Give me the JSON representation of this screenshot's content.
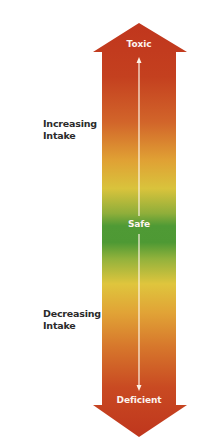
{
  "diagram": {
    "top_label": "Toxic",
    "center_label": "Safe",
    "bottom_label": "Deficient",
    "increasing": {
      "line1": "Increasing",
      "line2": "Intake"
    },
    "decreasing": {
      "line1": "Decreasing",
      "line2": "Intake"
    },
    "colors": {
      "toxic_red": "#c0391f",
      "orange": "#dc7a24",
      "yellow": "#e3c53a",
      "safe_green": "#4f9a35",
      "deficient_red": "#c23a1e",
      "inner_line": "#fdf3e6"
    }
  }
}
